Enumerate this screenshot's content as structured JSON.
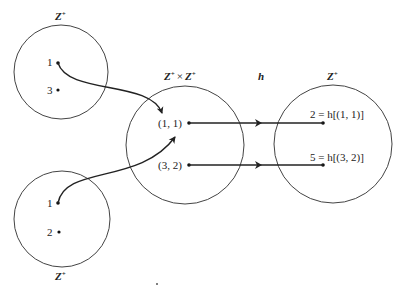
{
  "diagram": {
    "sets": {
      "top_left": {
        "label": "Z",
        "sup": "+",
        "elements": [
          "1",
          "3"
        ]
      },
      "bottom_left": {
        "label": "Z",
        "sup": "+",
        "elements": [
          "1",
          "2"
        ]
      },
      "middle": {
        "label": "Z",
        "sup": "+",
        "times": "×",
        "label2": "Z",
        "sup2": "+",
        "elements": [
          "(1, 1)",
          "(3, 2)"
        ]
      },
      "right": {
        "label": "Z",
        "sup": "+",
        "elements": [
          "2 = h[(1, 1)]",
          "5 = h[(3, 2)]"
        ]
      }
    },
    "function_label": "h",
    "mappings": [
      {
        "from": "(1, 1)",
        "to": "2 = h[(1, 1)]"
      },
      {
        "from": "(3, 2)",
        "to": "5 = h[(3, 2)]"
      }
    ],
    "pairing_arrows": [
      {
        "from": "top_left:1",
        "to": "(1, 1)"
      },
      {
        "from": "bottom_left:1",
        "to": "(1, 1)"
      }
    ]
  }
}
